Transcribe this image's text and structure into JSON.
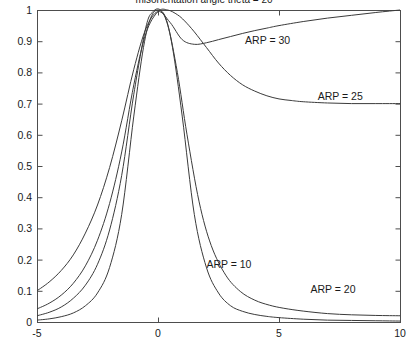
{
  "chart_data": {
    "type": "line",
    "title": "misorientation angle theta = 20",
    "xlabel": "",
    "ylabel": "",
    "xlim": [
      -5,
      10
    ],
    "ylim": [
      0,
      1
    ],
    "xticks": [
      "-5",
      "0",
      "5",
      "10"
    ],
    "xtick_values": [
      -5,
      0,
      5,
      10
    ],
    "yticks": [
      "0",
      "0.1",
      "0.2",
      "0.3",
      "0.4",
      "0.5",
      "0.6",
      "0.7",
      "0.8",
      "0.9",
      "1"
    ],
    "ytick_values": [
      0,
      0.1,
      0.2,
      0.3,
      0.4,
      0.5,
      0.6,
      0.7,
      0.8,
      0.9,
      1
    ],
    "grid": false,
    "legend_position": "inline-annotations",
    "annotations": [
      {
        "text": "ARP = 30",
        "x": 3.6,
        "y": 0.905
      },
      {
        "text": "ARP = 25",
        "x": 6.6,
        "y": 0.725
      },
      {
        "text": "ARP = 10",
        "x": 2.0,
        "y": 0.185
      },
      {
        "text": "ARP = 20",
        "x": 6.3,
        "y": 0.105
      }
    ],
    "series": [
      {
        "name": "ARP = 10",
        "x": [
          -5,
          -4.5,
          -4,
          -3.5,
          -3,
          -2.5,
          -2,
          -1.5,
          -1,
          -0.6,
          -0.3,
          0,
          0.3,
          0.6,
          1,
          1.5,
          2,
          2.5,
          3,
          3.5,
          4,
          4.5,
          5,
          6,
          7,
          8,
          9,
          10
        ],
        "y": [
          0.006,
          0.01,
          0.017,
          0.029,
          0.052,
          0.093,
          0.175,
          0.345,
          0.66,
          0.88,
          0.975,
          1.0,
          0.975,
          0.88,
          0.66,
          0.345,
          0.175,
          0.093,
          0.052,
          0.034,
          0.024,
          0.018,
          0.014,
          0.009,
          0.006,
          0.005,
          0.004,
          0.003
        ]
      },
      {
        "name": "ARP = 20",
        "x": [
          -5,
          -4.5,
          -4,
          -3.5,
          -3,
          -2.5,
          -2,
          -1.5,
          -1,
          -0.5,
          -0.2,
          0.1,
          0.4,
          0.8,
          1.2,
          1.7,
          2.2,
          2.8,
          3.4,
          4,
          4.6,
          5.2,
          6,
          7,
          8,
          9,
          10
        ],
        "y": [
          0.02,
          0.031,
          0.048,
          0.076,
          0.118,
          0.185,
          0.295,
          0.47,
          0.73,
          0.945,
          0.995,
          1.0,
          0.955,
          0.8,
          0.6,
          0.385,
          0.245,
          0.15,
          0.098,
          0.07,
          0.054,
          0.044,
          0.035,
          0.027,
          0.023,
          0.021,
          0.02
        ]
      },
      {
        "name": "ARP = 25",
        "x": [
          -5,
          -4.5,
          -4,
          -3.5,
          -3,
          -2.5,
          -2,
          -1.5,
          -1,
          -0.5,
          0,
          0.4,
          0.8,
          1.1,
          1.5,
          2,
          2.5,
          3,
          3.5,
          4,
          4.5,
          5,
          5.5,
          6,
          7,
          8,
          9,
          10
        ],
        "y": [
          0.042,
          0.06,
          0.086,
          0.124,
          0.18,
          0.262,
          0.38,
          0.545,
          0.76,
          0.925,
          0.995,
          1.0,
          0.985,
          0.965,
          0.93,
          0.88,
          0.83,
          0.79,
          0.76,
          0.74,
          0.725,
          0.715,
          0.71,
          0.706,
          0.702,
          0.7,
          0.7,
          0.7
        ]
      },
      {
        "name": "ARP = 30",
        "x": [
          -5,
          -4.5,
          -4,
          -3.5,
          -3,
          -2.5,
          -2,
          -1.5,
          -1,
          -0.5,
          0,
          0.5,
          1,
          1.5,
          2,
          2.5,
          3,
          3.5,
          4,
          4.5,
          5,
          6,
          7,
          8,
          9,
          10
        ],
        "y": [
          0.1,
          0.128,
          0.165,
          0.215,
          0.285,
          0.375,
          0.495,
          0.645,
          0.81,
          0.94,
          0.995,
          0.96,
          0.905,
          0.89,
          0.895,
          0.905,
          0.915,
          0.925,
          0.934,
          0.942,
          0.95,
          0.963,
          0.974,
          0.983,
          0.992,
          1.0
        ]
      }
    ]
  },
  "plot_geometry": {
    "left": 37,
    "right": 400,
    "top": 10,
    "bottom": 322
  }
}
